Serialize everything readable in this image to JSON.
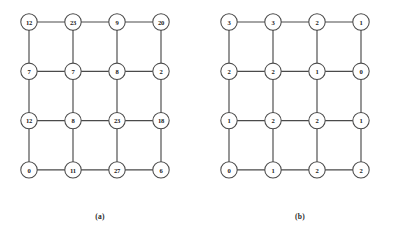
{
  "figure": {
    "background_color": "#ffffff",
    "stroke_color": "#4a4a4a",
    "node_fill_color": "#ffffff",
    "label_color": "#1a1a1a",
    "panels": [
      {
        "id": "panel-a",
        "caption": "(a)",
        "rows": 4,
        "cols": 4,
        "node_values": [
          [
            "12",
            "23",
            "9",
            "20"
          ],
          [
            "7",
            "7",
            "8",
            "2"
          ],
          [
            "12",
            "8",
            "23",
            "18"
          ],
          [
            "0",
            "11",
            "27",
            "6"
          ]
        ]
      },
      {
        "id": "panel-b",
        "caption": "(b)",
        "rows": 4,
        "cols": 4,
        "node_values": [
          [
            "3",
            "3",
            "2",
            "1"
          ],
          [
            "2",
            "2",
            "1",
            "0"
          ],
          [
            "1",
            "2",
            "2",
            "1"
          ],
          [
            "0",
            "1",
            "2",
            "2"
          ]
        ]
      }
    ]
  },
  "chart_data": {
    "type": "diagram",
    "title": "",
    "panels": [
      {
        "label": "(a)",
        "grid": [
          [
            12,
            23,
            9,
            20
          ],
          [
            7,
            7,
            8,
            2
          ],
          [
            12,
            8,
            23,
            18
          ],
          [
            0,
            11,
            27,
            6
          ]
        ]
      },
      {
        "label": "(b)",
        "grid": [
          [
            3,
            3,
            2,
            1
          ],
          [
            2,
            2,
            1,
            0
          ],
          [
            1,
            2,
            2,
            1
          ],
          [
            0,
            1,
            2,
            2
          ]
        ]
      }
    ]
  }
}
